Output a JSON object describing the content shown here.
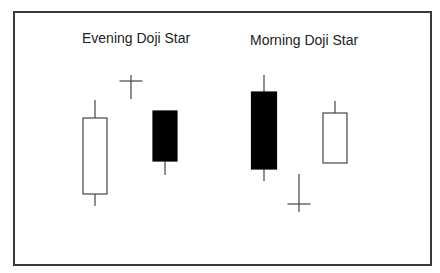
{
  "diagram": {
    "type": "candlestick-patterns",
    "colors": {
      "line": "#444444",
      "bearish_fill": "#000000",
      "bullish_fill": "#ffffff",
      "frame": "#3a3a3a"
    },
    "patterns": [
      {
        "title": "Evening Doji Star",
        "candles": [
          {
            "kind": "bullish",
            "x": 95,
            "body_top": 118,
            "body_bottom": 194,
            "wick_top": 100,
            "wick_bottom": 206,
            "width": 24
          },
          {
            "kind": "doji",
            "x": 131,
            "y": 81,
            "wick_top": 75,
            "wick_bottom": 99,
            "width": 23
          },
          {
            "kind": "bearish",
            "x": 165,
            "body_top": 111,
            "body_bottom": 161,
            "wick_top": 111,
            "wick_bottom": 175,
            "width": 24
          }
        ]
      },
      {
        "title": "Morning Doji Star",
        "candles": [
          {
            "kind": "bearish",
            "x": 264,
            "body_top": 92,
            "body_bottom": 169,
            "wick_top": 75,
            "wick_bottom": 181,
            "width": 25
          },
          {
            "kind": "doji",
            "x": 299,
            "y": 204,
            "wick_top": 174,
            "wick_bottom": 212,
            "width": 23
          },
          {
            "kind": "bullish",
            "x": 335,
            "body_top": 113,
            "body_bottom": 163,
            "wick_top": 101,
            "wick_bottom": 163,
            "width": 24
          }
        ]
      }
    ]
  }
}
